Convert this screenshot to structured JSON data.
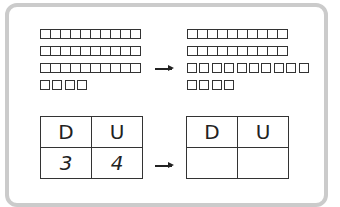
{
  "diagram": {
    "left_blocks": {
      "tens_rods": 3,
      "units": 4
    },
    "right_blocks": {
      "tens_rods": 2,
      "loose_units_row": 10,
      "units": 4
    },
    "arrow_icon": "right-arrow",
    "left_table": {
      "headers": [
        "D",
        "U"
      ],
      "values": [
        "3",
        "4"
      ]
    },
    "right_table": {
      "headers": [
        "D",
        "U"
      ],
      "values": [
        "",
        ""
      ]
    }
  }
}
